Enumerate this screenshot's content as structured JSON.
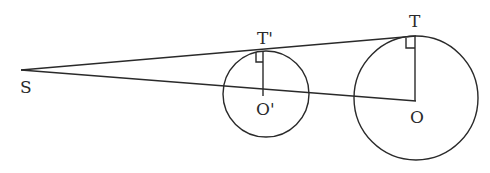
{
  "diagram": {
    "type": "geometry-tangent-circles",
    "labels": {
      "S": "S",
      "T_prime": "T'",
      "O_prime": "O'",
      "T": "T",
      "O": "O"
    },
    "points": {
      "S": [
        21,
        70
      ],
      "T_prime": [
        263,
        51
      ],
      "O_prime": [
        263,
        94
      ],
      "T": [
        414,
        36
      ],
      "O": [
        414,
        101
      ]
    },
    "circles": [
      {
        "name": "small-circle",
        "center": "O'",
        "cx": 266,
        "cy": 94,
        "r": 43
      },
      {
        "name": "large-circle",
        "center": "O",
        "cx": 416,
        "cy": 98,
        "r": 62
      }
    ],
    "segments": [
      {
        "name": "tangent-line-ST",
        "from": "S",
        "to": "T"
      },
      {
        "name": "line-SO",
        "from": "S",
        "to": "O"
      },
      {
        "name": "radius-O'T'",
        "from": "O'",
        "to": "T'"
      },
      {
        "name": "radius-OT",
        "from": "O",
        "to": "T"
      }
    ],
    "right_angle_marks": [
      "T'",
      "T"
    ]
  }
}
